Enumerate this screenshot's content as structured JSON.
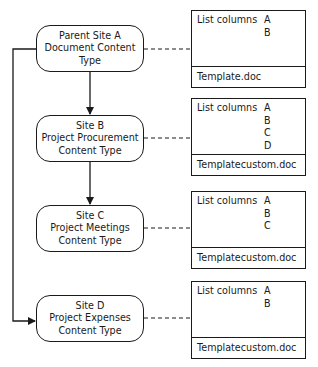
{
  "diagram": {
    "nodes": [
      {
        "id": "A",
        "lines": [
          "Parent Site A",
          "Document Content",
          "Type"
        ]
      },
      {
        "id": "B",
        "lines": [
          "Site B",
          "Project Procurement",
          "Content Type"
        ]
      },
      {
        "id": "C",
        "lines": [
          "Site C",
          "Project Meetings",
          "Content Type"
        ]
      },
      {
        "id": "D",
        "lines": [
          "Site D",
          "Project Expenses",
          "Content Type"
        ]
      }
    ],
    "boxes": [
      {
        "label": "List columns",
        "columns": [
          "A",
          "B"
        ],
        "template": "Template.doc"
      },
      {
        "label": "List columns",
        "columns": [
          "A",
          "B",
          "C",
          "D"
        ],
        "template": "Templatecustom.doc"
      },
      {
        "label": "List columns",
        "columns": [
          "A",
          "B",
          "C"
        ],
        "template": "Templatecustom.doc"
      },
      {
        "label": "List columns",
        "columns": [
          "A",
          "B"
        ],
        "template": "Templatecustom.doc"
      }
    ],
    "edges": [
      {
        "from": "A",
        "to": "B",
        "style": "solid-arrow"
      },
      {
        "from": "B",
        "to": "C",
        "style": "solid-arrow"
      },
      {
        "from": "A",
        "to": "D",
        "style": "solid-arrow-elbow-left"
      },
      {
        "from": "A",
        "to": "box-0",
        "style": "dashed"
      },
      {
        "from": "B",
        "to": "box-1",
        "style": "dashed"
      },
      {
        "from": "C",
        "to": "box-2",
        "style": "dashed"
      },
      {
        "from": "D",
        "to": "box-3",
        "style": "dashed"
      }
    ]
  }
}
